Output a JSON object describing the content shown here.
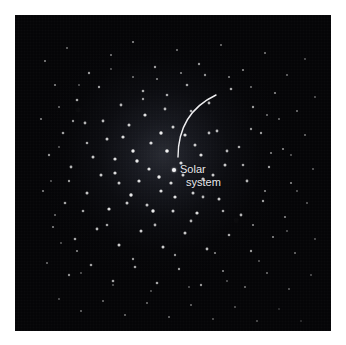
{
  "figure": {
    "kind": "astronomy-illustration",
    "background_color": "#ffffff",
    "plate_color": "#050507"
  },
  "plate": {
    "x": 15,
    "y": 15,
    "width": 316,
    "height": 316
  },
  "annotation": {
    "marker_name": "solar-system-marker",
    "marker_color": "#f2f2f4",
    "label_line1": "Solar",
    "label_line2": "system",
    "label_color": "#e8e8ec",
    "marker_x": 159,
    "marker_y": 155
  },
  "arc": {
    "name": "trajectory-arc",
    "color": "#f0f0f2",
    "stroke_width": 1.4,
    "start_x": 163,
    "start_y": 142,
    "end_x": 201,
    "end_y": 80,
    "control_x": 163,
    "control_y": 98
  },
  "chart_data": {
    "type": "scatter",
    "title": "",
    "xlabel": "",
    "ylabel": "",
    "xlim": [
      0,
      316
    ],
    "ylim": [
      0,
      316
    ],
    "grid": false,
    "legend": null,
    "annotations": [
      {
        "text": "Solar system",
        "x": 159,
        "y": 155
      }
    ],
    "series": [
      {
        "name": "stars",
        "marker": "point",
        "color": "#ffffff",
        "points": [
          [
            30,
            46,
            1.0,
            0.55
          ],
          [
            52,
            33,
            1.0,
            0.45
          ],
          [
            74,
            58,
            1.2,
            0.6
          ],
          [
            96,
            40,
            1.0,
            0.5
          ],
          [
            118,
            27,
            1.1,
            0.55
          ],
          [
            140,
            52,
            1.2,
            0.62
          ],
          [
            162,
            35,
            1.0,
            0.5
          ],
          [
            184,
            49,
            1.2,
            0.58
          ],
          [
            206,
            30,
            1.0,
            0.48
          ],
          [
            228,
            55,
            1.1,
            0.55
          ],
          [
            250,
            38,
            1.0,
            0.5
          ],
          [
            272,
            60,
            1.0,
            0.45
          ],
          [
            290,
            44,
            0.9,
            0.4
          ],
          [
            40,
            70,
            1.1,
            0.52
          ],
          [
            62,
            85,
            1.3,
            0.65
          ],
          [
            84,
            72,
            1.2,
            0.62
          ],
          [
            106,
            90,
            1.4,
            0.7
          ],
          [
            128,
            76,
            1.3,
            0.66
          ],
          [
            150,
            94,
            1.4,
            0.72
          ],
          [
            172,
            70,
            1.3,
            0.64
          ],
          [
            194,
            88,
            1.4,
            0.7
          ],
          [
            216,
            74,
            1.3,
            0.65
          ],
          [
            238,
            92,
            1.2,
            0.6
          ],
          [
            260,
            78,
            1.1,
            0.55
          ],
          [
            282,
            96,
            1.0,
            0.48
          ],
          [
            300,
            82,
            0.9,
            0.42
          ],
          [
            26,
            104,
            1.1,
            0.52
          ],
          [
            48,
            118,
            1.3,
            0.62
          ],
          [
            70,
            108,
            1.4,
            0.7
          ],
          [
            92,
            124,
            1.5,
            0.78
          ],
          [
            114,
            110,
            1.5,
            0.8
          ],
          [
            136,
            128,
            1.6,
            0.85
          ],
          [
            158,
            112,
            1.5,
            0.8
          ],
          [
            180,
            130,
            1.5,
            0.78
          ],
          [
            202,
            116,
            1.4,
            0.72
          ],
          [
            224,
            132,
            1.3,
            0.66
          ],
          [
            246,
            118,
            1.2,
            0.6
          ],
          [
            268,
            134,
            1.1,
            0.55
          ],
          [
            290,
            120,
            1.0,
            0.46
          ],
          [
            34,
            140,
            1.2,
            0.58
          ],
          [
            56,
            152,
            1.4,
            0.7
          ],
          [
            78,
            142,
            1.5,
            0.78
          ],
          [
            100,
            158,
            1.6,
            0.86
          ],
          [
            122,
            146,
            1.7,
            0.9
          ],
          [
            144,
            162,
            1.7,
            0.92
          ],
          [
            166,
            148,
            1.6,
            0.86
          ],
          [
            188,
            164,
            1.6,
            0.86
          ],
          [
            210,
            150,
            1.5,
            0.78
          ],
          [
            232,
            166,
            1.4,
            0.7
          ],
          [
            254,
            152,
            1.2,
            0.62
          ],
          [
            276,
            168,
            1.1,
            0.54
          ],
          [
            298,
            154,
            0.9,
            0.44
          ],
          [
            28,
            176,
            1.1,
            0.52
          ],
          [
            50,
            188,
            1.3,
            0.64
          ],
          [
            72,
            178,
            1.5,
            0.76
          ],
          [
            94,
            194,
            1.6,
            0.86
          ],
          [
            116,
            180,
            1.7,
            0.9
          ],
          [
            138,
            196,
            1.7,
            0.92
          ],
          [
            160,
            182,
            1.6,
            0.88
          ],
          [
            182,
            198,
            1.6,
            0.86
          ],
          [
            204,
            184,
            1.5,
            0.78
          ],
          [
            226,
            200,
            1.4,
            0.7
          ],
          [
            248,
            186,
            1.2,
            0.62
          ],
          [
            270,
            202,
            1.1,
            0.54
          ],
          [
            292,
            188,
            0.9,
            0.44
          ],
          [
            38,
            212,
            1.1,
            0.52
          ],
          [
            60,
            224,
            1.3,
            0.64
          ],
          [
            82,
            214,
            1.4,
            0.72
          ],
          [
            104,
            230,
            1.5,
            0.8
          ],
          [
            126,
            216,
            1.5,
            0.8
          ],
          [
            148,
            232,
            1.5,
            0.8
          ],
          [
            170,
            218,
            1.5,
            0.78
          ],
          [
            192,
            234,
            1.4,
            0.72
          ],
          [
            214,
            220,
            1.3,
            0.66
          ],
          [
            236,
            236,
            1.2,
            0.6
          ],
          [
            258,
            222,
            1.1,
            0.54
          ],
          [
            280,
            238,
            1.0,
            0.46
          ],
          [
            300,
            224,
            0.9,
            0.4
          ],
          [
            32,
            248,
            1.0,
            0.46
          ],
          [
            54,
            260,
            1.2,
            0.56
          ],
          [
            76,
            250,
            1.3,
            0.62
          ],
          [
            98,
            266,
            1.3,
            0.64
          ],
          [
            120,
            252,
            1.3,
            0.64
          ],
          [
            142,
            268,
            1.3,
            0.64
          ],
          [
            164,
            254,
            1.2,
            0.6
          ],
          [
            186,
            270,
            1.2,
            0.58
          ],
          [
            208,
            256,
            1.1,
            0.54
          ],
          [
            230,
            272,
            1.0,
            0.48
          ],
          [
            252,
            258,
            1.0,
            0.46
          ],
          [
            274,
            274,
            0.9,
            0.42
          ],
          [
            296,
            260,
            0.9,
            0.38
          ],
          [
            44,
            284,
            0.9,
            0.4
          ],
          [
            66,
            296,
            1.0,
            0.44
          ],
          [
            88,
            286,
            1.0,
            0.46
          ],
          [
            110,
            300,
            1.0,
            0.46
          ],
          [
            132,
            288,
            1.0,
            0.46
          ],
          [
            154,
            302,
            1.0,
            0.46
          ],
          [
            176,
            290,
            1.0,
            0.44
          ],
          [
            198,
            304,
            0.9,
            0.4
          ],
          [
            220,
            292,
            0.9,
            0.4
          ],
          [
            242,
            306,
            0.9,
            0.38
          ],
          [
            264,
            294,
            0.8,
            0.34
          ],
          [
            286,
            306,
            0.8,
            0.32
          ],
          [
            130,
            100,
            1.6,
            0.88
          ],
          [
            146,
            118,
            1.7,
            0.92
          ],
          [
            118,
            136,
            1.7,
            0.92
          ],
          [
            134,
            154,
            1.6,
            0.88
          ],
          [
            152,
            136,
            1.8,
            0.95
          ],
          [
            170,
            120,
            1.6,
            0.86
          ],
          [
            186,
            140,
            1.6,
            0.86
          ],
          [
            168,
            160,
            1.5,
            0.82
          ],
          [
            108,
            122,
            1.6,
            0.86
          ],
          [
            100,
            144,
            1.6,
            0.86
          ],
          [
            124,
            166,
            1.6,
            0.86
          ],
          [
            146,
            176,
            1.6,
            0.86
          ],
          [
            178,
            178,
            1.5,
            0.8
          ],
          [
            198,
            160,
            1.5,
            0.78
          ],
          [
            88,
            106,
            1.4,
            0.72
          ],
          [
            86,
            160,
            1.5,
            0.78
          ],
          [
            112,
            188,
            1.5,
            0.78
          ],
          [
            158,
            196,
            1.5,
            0.8
          ],
          [
            194,
            118,
            1.4,
            0.72
          ],
          [
            212,
            136,
            1.4,
            0.7
          ],
          [
            72,
            128,
            1.3,
            0.66
          ],
          [
            68,
            196,
            1.3,
            0.64
          ],
          [
            92,
            210,
            1.3,
            0.64
          ],
          [
            140,
            210,
            1.4,
            0.7
          ],
          [
            176,
            206,
            1.4,
            0.7
          ],
          [
            208,
            196,
            1.3,
            0.66
          ],
          [
            228,
            150,
            1.3,
            0.64
          ],
          [
            236,
            114,
            1.2,
            0.58
          ],
          [
            58,
            106,
            1.2,
            0.58
          ],
          [
            54,
            166,
            1.2,
            0.6
          ],
          [
            62,
            236,
            1.1,
            0.54
          ],
          [
            118,
            244,
            1.2,
            0.58
          ],
          [
            160,
            240,
            1.2,
            0.58
          ],
          [
            200,
            238,
            1.1,
            0.54
          ],
          [
            238,
            210,
            1.1,
            0.54
          ],
          [
            250,
            176,
            1.1,
            0.54
          ],
          [
            256,
            138,
            1.1,
            0.52
          ],
          [
            252,
            100,
            1.0,
            0.48
          ],
          [
            44,
            92,
            1.0,
            0.46
          ],
          [
            40,
            200,
            1.0,
            0.46
          ],
          [
            214,
            62,
            1.1,
            0.52
          ],
          [
            190,
            60,
            1.2,
            0.56
          ],
          [
            166,
            58,
            1.1,
            0.52
          ],
          [
            142,
            64,
            1.1,
            0.52
          ],
          [
            118,
            62,
            1.0,
            0.48
          ],
          [
            236,
            72,
            1.0,
            0.48
          ],
          [
            264,
            104,
            1.0,
            0.46
          ],
          [
            276,
            140,
            0.9,
            0.42
          ],
          [
            282,
            176,
            0.9,
            0.42
          ],
          [
            272,
            216,
            0.9,
            0.4
          ],
          [
            244,
            246,
            0.9,
            0.4
          ],
          [
            212,
            266,
            0.9,
            0.4
          ],
          [
            174,
            272,
            0.9,
            0.4
          ],
          [
            136,
            276,
            0.9,
            0.4
          ],
          [
            98,
            270,
            0.9,
            0.4
          ],
          [
            66,
            258,
            0.9,
            0.4
          ],
          [
            46,
            228,
            0.9,
            0.4
          ],
          [
            36,
            166,
            0.9,
            0.42
          ],
          [
            44,
            132,
            0.9,
            0.42
          ],
          [
            64,
            70,
            0.9,
            0.4
          ],
          [
            96,
            54,
            0.9,
            0.4
          ],
          [
            152,
            80,
            1.3,
            0.66
          ],
          [
            128,
            84,
            1.2,
            0.6
          ],
          [
            176,
            96,
            1.3,
            0.64
          ],
          [
            104,
            168,
            1.5,
            0.78
          ],
          [
            132,
            190,
            1.5,
            0.76
          ],
          [
            156,
            168,
            1.6,
            0.84
          ],
          [
            188,
            182,
            1.4,
            0.72
          ]
        ]
      }
    ]
  }
}
